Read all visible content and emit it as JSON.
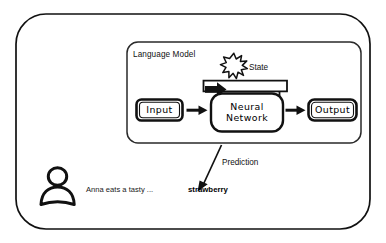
{
  "diagram": {
    "background_color": "#ffffff",
    "stroke_color": "#111111",
    "outer_frame": {
      "name": "outer-frame"
    },
    "language_model_panel": {
      "label": "Language Model"
    },
    "state": {
      "label": "State",
      "icon": "starburst-icon"
    },
    "nodes": {
      "input": {
        "label": "Input"
      },
      "neural_network": {
        "label_line1": "Neural",
        "label_line2": "Network"
      },
      "output": {
        "label": "Output"
      }
    },
    "prediction": {
      "label": "Prediction"
    },
    "user": {
      "icon": "person-icon",
      "sentence": "Anna eats a tasty ...",
      "predicted_word": "strawberry"
    },
    "arrows": {
      "input_to_nn": "arrow-right",
      "nn_to_output": "arrow-right",
      "recurrent_state": "arrow-loop-down-right",
      "prediction_arrow": "arrow-down-left"
    }
  }
}
